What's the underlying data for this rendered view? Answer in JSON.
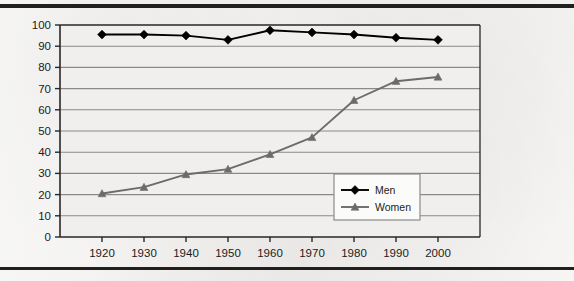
{
  "chart_data": {
    "type": "line",
    "title": "",
    "subtitle": "",
    "xlabel": "",
    "ylabel": "",
    "categories": [
      "1920",
      "1930",
      "1940",
      "1950",
      "1960",
      "1970",
      "1980",
      "1990",
      "2000"
    ],
    "x": [
      1920,
      1930,
      1940,
      1950,
      1960,
      1970,
      1980,
      1990,
      2000
    ],
    "series": [
      {
        "name": "Men",
        "marker": "diamond",
        "color": "#000000",
        "values": [
          95.5,
          95.5,
          95,
          93,
          97.5,
          96.5,
          95.5,
          94,
          93
        ]
      },
      {
        "name": "Women",
        "marker": "triangle",
        "color": "#6b6b6b",
        "values": [
          20.5,
          23.5,
          29.5,
          32,
          39,
          47,
          64.5,
          73.5,
          75.5
        ]
      }
    ],
    "ylim": [
      0,
      100
    ],
    "ytick_step": 10,
    "yticks": [
      "0",
      "10",
      "20",
      "30",
      "40",
      "50",
      "60",
      "70",
      "80",
      "90",
      "100"
    ],
    "xticks": [
      "1920",
      "1930",
      "1940",
      "1950",
      "1960",
      "1970",
      "1980",
      "1990",
      "2000"
    ],
    "grid": "horizontal",
    "legend_position": "inside-lower-right",
    "legend_entries": [
      "Men",
      "Women"
    ]
  },
  "axis": {
    "y_ticks": [
      "100",
      "90",
      "80",
      "70",
      "60",
      "50",
      "40",
      "30",
      "20",
      "10",
      "0"
    ],
    "x_ticks": [
      "1920",
      "1930",
      "1940",
      "1950",
      "1960",
      "1970",
      "1980",
      "1990",
      "2000"
    ]
  },
  "legend": {
    "items": [
      {
        "label": "Men"
      },
      {
        "label": "Women"
      }
    ]
  },
  "colors": {
    "men_series": "#000000",
    "women_series": "#6b6b6b",
    "gridline": "#8a8a8a",
    "axis": "#2a2726",
    "plot_background": "#f0efed",
    "page_background": "#f2f1ef",
    "rule": "#231f1e",
    "legend_background": "#fbfbfa",
    "legend_border": "#8a8a8a"
  }
}
